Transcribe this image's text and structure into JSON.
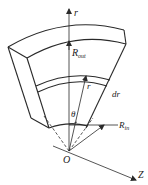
{
  "diagram": {
    "labels": {
      "r_axis": "r",
      "r_out": "R",
      "r_out_sub": "out",
      "dr": "dr",
      "r_vector": "r",
      "theta": "θ",
      "r_in": "R",
      "r_in_sub": "in",
      "origin": "O",
      "z_axis": "Z"
    }
  }
}
